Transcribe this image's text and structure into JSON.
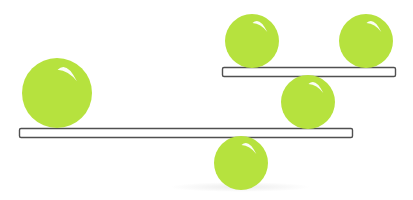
{
  "canvas": {
    "width": 413,
    "height": 200,
    "background": "#ffffff"
  },
  "colors": {
    "ball": "#b6e23e",
    "ball_highlight": "#ffffff",
    "plank_fill": "#ffffff",
    "plank_stroke": "#505050",
    "shadow": "#ececec"
  },
  "shadow": {
    "cx": 240,
    "cy": 187,
    "rx": 70,
    "ry": 5
  },
  "planks": [
    {
      "id": "lower-plank",
      "x": 19,
      "y": 128,
      "width": 333,
      "height": 9
    },
    {
      "id": "upper-plank",
      "x": 222,
      "y": 67,
      "width": 173,
      "height": 9
    }
  ],
  "balls": [
    {
      "id": "large-ball-left",
      "cx": 57,
      "cy": 93,
      "r": 35
    },
    {
      "id": "ball-top-left",
      "cx": 252,
      "cy": 41,
      "r": 27
    },
    {
      "id": "ball-top-right",
      "cx": 366,
      "cy": 41,
      "r": 27
    },
    {
      "id": "ball-middle",
      "cx": 308,
      "cy": 102,
      "r": 27
    },
    {
      "id": "ball-bottom",
      "cx": 241,
      "cy": 163,
      "r": 27
    }
  ]
}
